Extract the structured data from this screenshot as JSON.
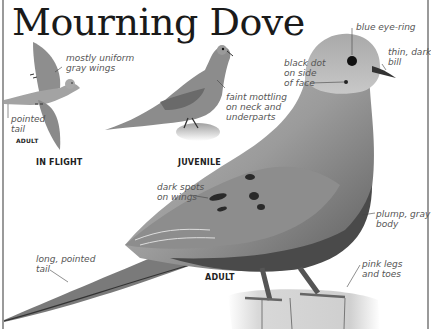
{
  "title": "Mourning Dove",
  "views": {
    "in_flight": {
      "caption": "IN FLIGHT",
      "sub_caption": "ADULT",
      "labels": {
        "wings": "mostly uniform\ngray wings",
        "tail": "pointed\ntail"
      }
    },
    "juvenile": {
      "caption": "JUVENILE",
      "labels": {
        "mottling": "faint mottling\non neck and\nunderparts"
      }
    },
    "adult": {
      "caption": "ADULT",
      "labels": {
        "eye_ring": "blue eye-ring",
        "bill": "thin, dark\nbill",
        "face_dot": "black dot\non side\nof face",
        "wing_spots": "dark spots\non wings",
        "body": "plump, gray\nbody",
        "tail": "long, pointed\ntail",
        "legs": "pink legs\nand toes"
      }
    }
  },
  "colors": {
    "plumage": "#9a9a9a",
    "plumage_light": "#c4c4c4",
    "plumage_dark": "#5a5a5a",
    "spot": "#2a2a2a",
    "label_text": "#555555",
    "title_text": "#1a1a1a"
  }
}
